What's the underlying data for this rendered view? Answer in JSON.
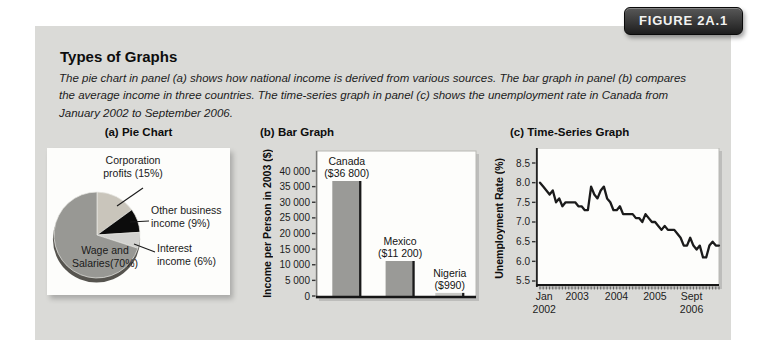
{
  "figure": {
    "badge": "FIGURE 2A.1",
    "title": "Types of Graphs",
    "caption": "The pie chart in panel (a) shows how national income is derived from various sources. The bar graph in panel (b) compares the average income in three countries. The time-series graph in panel (c) shows the unemployment rate in Canada from January 2002 to September 2006."
  },
  "panels": {
    "pie": {
      "title": "(a) Pie Chart"
    },
    "bar": {
      "title": "(b) Bar Graph"
    },
    "line": {
      "title": "(c) Time-Series Graph"
    }
  },
  "colors": {
    "figure_background": "#dadad7",
    "panel_background": "#fdfdfb",
    "badge_background": "#2c2c2c",
    "badge_text": "#f2f2f0",
    "bar_fill": "#9a9a97",
    "bar_edge": "#1a1a1a",
    "line_stroke": "#1b1b1b",
    "pie_shadow": "#56544f",
    "axis_dark": "#161616",
    "plot_border": "#b8b8b4"
  },
  "chart_data": [
    {
      "type": "pie",
      "panel": "(a) Pie Chart",
      "start": "12 o'clock",
      "direction": "clockwise",
      "slices": [
        {
          "label": "Corporation profits (15%)",
          "label_lines": [
            "Corporation",
            "profits (15%)"
          ],
          "value": 15,
          "color": "#c9c5bb"
        },
        {
          "label": "Other business income (9%)",
          "label_lines": [
            "Other business",
            "income (9%)"
          ],
          "value": 9,
          "color": "#0c0c0c"
        },
        {
          "label": "Interest income (6%)",
          "label_lines": [
            "Interest",
            "income (6%)"
          ],
          "value": 6,
          "color": "#d2d2cf"
        },
        {
          "label": "Wage and Salaries(70%)",
          "label_lines": [
            "Wage and",
            "Salaries(70%)"
          ],
          "value": 70,
          "color": "#989894"
        }
      ]
    },
    {
      "type": "bar",
      "panel": "(b) Bar Graph",
      "ylabel": "Income per Person in 2003 ($)",
      "categories": [
        "Canada",
        "Mexico",
        "Nigeria"
      ],
      "values": [
        36800,
        11200,
        990
      ],
      "value_labels": [
        "($36 800)",
        "($11 200)",
        "($990)"
      ],
      "bar_colors": [
        "#9a9a97",
        "#9a9a97",
        "#c9c9c5"
      ],
      "ytick_values": [
        0,
        5000,
        10000,
        15000,
        20000,
        25000,
        30000,
        35000,
        40000
      ],
      "ytick_labels": [
        "0",
        "5 000",
        "10 000",
        "15 000",
        "20 000",
        "25 000",
        "30 000",
        "35 000",
        "40 000"
      ],
      "ylim": [
        0,
        46000
      ],
      "grid": false
    },
    {
      "type": "line",
      "panel": "(c) Time-Series Graph",
      "ylabel": "Unemployment Rate (%)",
      "x_range": "Jan 2002 to Sept 2006, monthly",
      "ytick_values": [
        5.5,
        6.0,
        6.5,
        7.0,
        7.5,
        8.0,
        8.5
      ],
      "ytick_labels": [
        "5.5",
        "6.0",
        "6.5",
        "7.0",
        "7.5",
        "8.0",
        "8.5"
      ],
      "ylim": [
        5.4,
        8.9
      ],
      "grid": false,
      "x_tick_labels": [
        {
          "lines": [
            "Jan",
            "2002"
          ],
          "frac": 0.045
        },
        {
          "lines": [
            "2003"
          ],
          "frac": 0.225
        },
        {
          "lines": [
            "2004"
          ],
          "frac": 0.44
        },
        {
          "lines": [
            "2005"
          ],
          "frac": 0.65
        },
        {
          "lines": [
            "Sept",
            "2006"
          ],
          "frac": 0.85
        }
      ],
      "series": [
        {
          "name": "Canada unemployment rate (%)",
          "values": [
            8.0,
            7.9,
            7.8,
            7.7,
            7.8,
            7.5,
            7.6,
            7.4,
            7.5,
            7.5,
            7.5,
            7.5,
            7.4,
            7.4,
            7.3,
            7.3,
            7.9,
            7.7,
            7.6,
            7.8,
            7.9,
            7.6,
            7.5,
            7.3,
            7.3,
            7.4,
            7.2,
            7.2,
            7.2,
            7.2,
            7.1,
            7.1,
            7.0,
            7.2,
            7.1,
            7.0,
            7.0,
            6.9,
            6.8,
            6.9,
            6.8,
            6.8,
            6.8,
            6.7,
            6.6,
            6.4,
            6.4,
            6.6,
            6.4,
            6.3,
            6.4,
            6.1,
            6.1,
            6.4,
            6.5,
            6.4,
            6.4
          ]
        }
      ]
    }
  ]
}
